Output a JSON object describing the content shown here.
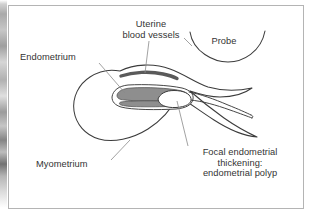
{
  "figure": {
    "type": "anatomical-line-diagram",
    "background_color": "#ffffff",
    "frame_color": "#b4b4b4",
    "text_color": "#333333"
  },
  "labels": {
    "uterine_blood_vessels": "Uterine\nblood vessels",
    "probe": "Probe",
    "endometrium": "Endometrium",
    "myometrium": "Myometrium",
    "focal_polyp": "Focal endometrial\nthickening:\nendometrial polyp"
  },
  "structures": {
    "uterus_body": {
      "name": "uterus-outline",
      "fill": "#ffffff",
      "stroke": "#3c3c3c"
    },
    "endometrial_cavity": {
      "name": "endometrium-shading",
      "fill": "#8e8e8e",
      "stroke": "#3c3c3c"
    },
    "blood_vessel": {
      "name": "uterine-blood-vessel",
      "fill": "#5a5a5a",
      "stroke": "#4a4a4a"
    },
    "polyp": {
      "name": "endometrial-polyp",
      "fill": "#ffffff",
      "stroke": "#3c3c3c"
    },
    "probe_arc": {
      "name": "probe-outline",
      "fill": "none",
      "stroke": "#3c3c3c"
    },
    "leader_line": {
      "name": "leader-line",
      "stroke": "#8a8a8a"
    }
  }
}
